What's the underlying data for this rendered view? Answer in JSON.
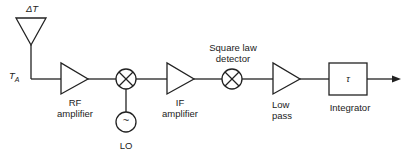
{
  "diagram": {
    "antenna": {
      "top_label": "ΔT",
      "input_label": "T",
      "input_sub": "A"
    },
    "blocks": [
      {
        "id": "rf",
        "label_line1": "RF",
        "label_line2": "amplifier"
      },
      {
        "id": "mixer",
        "label": ""
      },
      {
        "id": "lo",
        "symbol": "~",
        "label": "LO"
      },
      {
        "id": "if",
        "label_line1": "IF",
        "label_line2": "amplifier"
      },
      {
        "id": "sqlaw",
        "label_line1": "Square law",
        "label_line2": "detector"
      },
      {
        "id": "lowpass",
        "label_line1": "Low",
        "label_line2": "pass"
      },
      {
        "id": "integrator",
        "symbol": "τ",
        "label": "Integrator"
      }
    ],
    "colors": {
      "stroke": "#222222",
      "background": "#ffffff"
    }
  }
}
